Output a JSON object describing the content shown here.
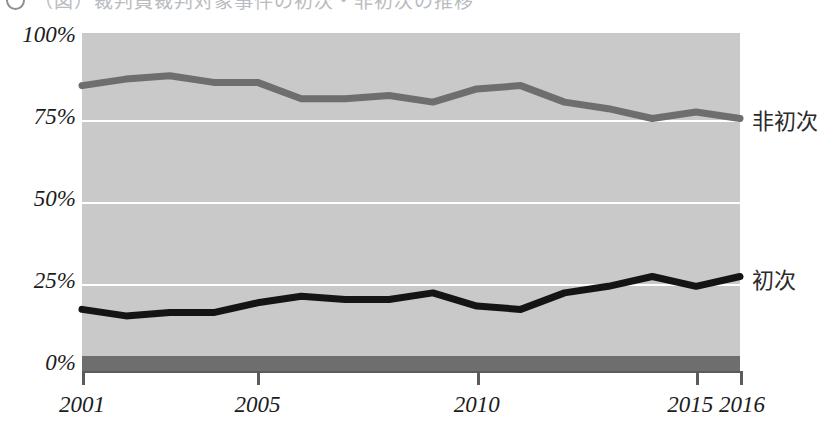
{
  "header": {
    "bullet_icon": "circle-number-icon",
    "title": "（図）裁判員裁判対象事件の初次・非初次の推移"
  },
  "chart_data": {
    "type": "line",
    "title": "",
    "xlabel": "",
    "ylabel": "",
    "x": [
      2001,
      2002,
      2003,
      2004,
      2005,
      2006,
      2007,
      2008,
      2009,
      2010,
      2011,
      2012,
      2013,
      2014,
      2015,
      2016
    ],
    "x_tick_labels": [
      "2001",
      "2005",
      "2010",
      "2015",
      "2016"
    ],
    "x_ticks": [
      2001,
      2005,
      2010,
      2015,
      2016
    ],
    "y_tick_labels": [
      "100%",
      "75%",
      "50%",
      "25%",
      "0%"
    ],
    "y_ticks": [
      100,
      75,
      50,
      25,
      0
    ],
    "ylim": [
      0,
      100
    ],
    "grid": true,
    "grid_color": "#ffffff",
    "plot_background": "#c9c9c9",
    "legend_position": "right-inline",
    "series": [
      {
        "name": "非初次",
        "color": "#6e6e6e",
        "label_y_percent": 74,
        "values": [
          84,
          86,
          87,
          85,
          85,
          80,
          80,
          81,
          79,
          83,
          84,
          79,
          77,
          74,
          76,
          74
        ]
      },
      {
        "name": "初次",
        "color": "#141414",
        "label_y_percent": 26,
        "values": [
          16,
          14,
          15,
          15,
          18,
          20,
          19,
          19,
          21,
          17,
          16,
          21,
          23,
          26,
          23,
          26
        ]
      }
    ],
    "baseline_band": {
      "name": "zero-baseline-band",
      "color": "#6e6e6e",
      "value": 0
    }
  }
}
